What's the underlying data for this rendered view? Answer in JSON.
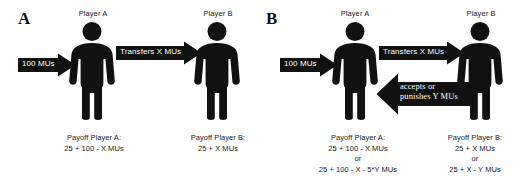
{
  "figure": {
    "background_color": "#ffffff",
    "ink_color": "#111111",
    "arrow_label_color": "#ffffff"
  },
  "panels": [
    {
      "letter": "A",
      "players": [
        {
          "label": "Player A",
          "icon": "person-pictogram-icon"
        },
        {
          "label": "Player B",
          "icon": "person-pictogram-icon"
        }
      ],
      "arrows": [
        {
          "name": "endowment-arrow",
          "label": "100 MUs",
          "direction": "right"
        },
        {
          "name": "transfer-arrow",
          "label": "Transfers X MUs",
          "direction": "right"
        }
      ],
      "payoffs": [
        {
          "title": "Payoff Player A:",
          "lines": [
            "25 + 100 - X MUs"
          ]
        },
        {
          "title": "Payoff Player B:",
          "lines": [
            "25 + X MUs"
          ]
        }
      ]
    },
    {
      "letter": "B",
      "players": [
        {
          "label": "Player A",
          "icon": "person-pictogram-icon"
        },
        {
          "label": "Player B",
          "icon": "person-pictogram-icon"
        }
      ],
      "arrows": [
        {
          "name": "endowment-arrow",
          "label": "100 MUs",
          "direction": "right"
        },
        {
          "name": "transfer-arrow",
          "label": "Transfers X MUs",
          "direction": "right"
        },
        {
          "name": "punishment-arrow",
          "label_line1": "accepts or",
          "label_line2": "punishes Y MUs",
          "direction": "left"
        }
      ],
      "payoffs": [
        {
          "title": "Payoff Player A:",
          "lines": [
            "25 + 100 - X MUs",
            "or",
            "25 + 100 - X - 5*Y MUs"
          ]
        },
        {
          "title": "Payoff Player B:",
          "lines": [
            "25 + X MUs",
            "or",
            "25 + X - Y MUs"
          ]
        }
      ]
    }
  ]
}
